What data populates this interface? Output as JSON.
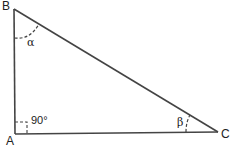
{
  "diagram": {
    "type": "right-triangle",
    "vertices": {
      "A": {
        "label": "A",
        "x": 15,
        "y": 134
      },
      "B": {
        "label": "B",
        "x": 14,
        "y": 9
      },
      "C": {
        "label": "C",
        "x": 218,
        "y": 132
      }
    },
    "angles": {
      "alpha": {
        "label": "α",
        "vertex": "B"
      },
      "beta": {
        "label": "β",
        "vertex": "C"
      },
      "right": {
        "label": "90°",
        "vertex": "A"
      }
    },
    "colors": {
      "stroke": "#333333",
      "text": "#222222"
    }
  }
}
